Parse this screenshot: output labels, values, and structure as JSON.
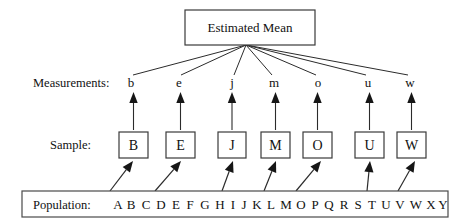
{
  "diagram": {
    "title_box": {
      "label": "Estimated Mean",
      "x": 185,
      "y": 10,
      "width": 130,
      "height": 35
    },
    "rows": {
      "measurements_label": "Measurements:",
      "sample_label": "Sample:",
      "population_label": "Population:"
    },
    "measurements": [
      {
        "letter": "b",
        "x": 131
      },
      {
        "letter": "e",
        "x": 179
      },
      {
        "letter": "j",
        "x": 232
      },
      {
        "letter": "m",
        "x": 274
      },
      {
        "letter": "o",
        "x": 318
      },
      {
        "letter": "u",
        "x": 368
      },
      {
        "letter": "w",
        "x": 410
      }
    ],
    "sample_boxes": [
      {
        "letter": "B",
        "x": 119,
        "y": 132,
        "width": 29,
        "height": 26
      },
      {
        "letter": "E",
        "x": 166,
        "y": 132,
        "width": 29,
        "height": 26
      },
      {
        "letter": "J",
        "x": 218,
        "y": 132,
        "width": 28,
        "height": 26
      },
      {
        "letter": "M",
        "x": 261,
        "y": 132,
        "width": 29,
        "height": 26
      },
      {
        "letter": "O",
        "x": 303,
        "y": 132,
        "width": 29,
        "height": 26
      },
      {
        "letter": "U",
        "x": 355,
        "y": 132,
        "width": 29,
        "height": 26
      },
      {
        "letter": "W",
        "x": 397,
        "y": 132,
        "width": 29,
        "height": 26
      }
    ],
    "population_box": {
      "x": 22,
      "y": 191,
      "width": 426,
      "height": 26
    },
    "population_letters": [
      {
        "letter": "A",
        "x": 118
      },
      {
        "letter": "B",
        "x": 131
      },
      {
        "letter": "C",
        "x": 146
      },
      {
        "letter": "D",
        "x": 161
      },
      {
        "letter": "E",
        "x": 176
      },
      {
        "letter": "F",
        "x": 190
      },
      {
        "letter": "G",
        "x": 205
      },
      {
        "letter": "H",
        "x": 220
      },
      {
        "letter": "I",
        "x": 233
      },
      {
        "letter": "J",
        "x": 244
      },
      {
        "letter": "K",
        "x": 257
      },
      {
        "letter": "L",
        "x": 271
      },
      {
        "letter": "M",
        "x": 286
      },
      {
        "letter": "O",
        "x": 301
      },
      {
        "letter": "P",
        "x": 315
      },
      {
        "letter": "Q",
        "x": 329
      },
      {
        "letter": "R",
        "x": 344
      },
      {
        "letter": "S",
        "x": 358
      },
      {
        "letter": "T",
        "x": 372
      },
      {
        "letter": "U",
        "x": 386
      },
      {
        "letter": "V",
        "x": 400
      },
      {
        "letter": "W",
        "x": 416
      },
      {
        "letter": "X",
        "x": 431
      },
      {
        "letter": "Y",
        "x": 443
      }
    ],
    "fan_origin": {
      "x": 246,
      "y": 45
    },
    "sampling_arrows": [
      {
        "from_x": 110,
        "from_y": 191,
        "to_x": 133,
        "to_y": 161
      },
      {
        "from_x": 155,
        "from_y": 191,
        "to_x": 181,
        "to_y": 161
      },
      {
        "from_x": 222,
        "from_y": 191,
        "to_x": 233,
        "to_y": 161
      },
      {
        "from_x": 264,
        "from_y": 191,
        "to_x": 276,
        "to_y": 161
      },
      {
        "from_x": 296,
        "from_y": 191,
        "to_x": 321,
        "to_y": 161
      },
      {
        "from_x": 367,
        "from_y": 191,
        "to_x": 370,
        "to_y": 161
      },
      {
        "from_x": 398,
        "from_y": 191,
        "to_x": 415,
        "to_y": 161
      }
    ],
    "colors": {
      "stroke": "#2b2b2b",
      "box_stroke": "#3a3a3a",
      "text": "#111111",
      "background": "#ffffff"
    }
  }
}
